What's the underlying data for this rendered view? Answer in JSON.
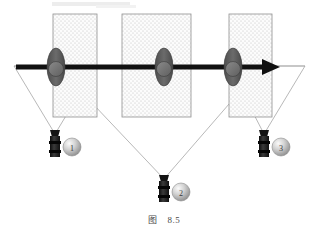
{
  "figure": {
    "caption_label": "图",
    "caption_number": "8.5",
    "title": "",
    "background_color": "#ffffff",
    "line_color_thin": "#9a9a9a",
    "axis_color": "#111111",
    "region_fill": "#fbfbfb",
    "region_border": "#8f8f8f",
    "region_dot_color": "#b9b9b9",
    "ellipse_fill": "#5d5d5d",
    "ellipse_inner_fill": "#7a7a7a",
    "camera_body_color": "#1b1b1b",
    "sphere_light": "#f2f2f2",
    "sphere_mid": "#b6b6b6",
    "sphere_dark": "#7c7c7c",
    "label_color": "#3a3a3a"
  },
  "axis": {
    "name": "horizontal-axis-arrow",
    "start_x": 16,
    "end_x": 279,
    "y": 67,
    "thickness": 5
  },
  "regions": [
    {
      "id": "region-left",
      "x": 53,
      "y": 14,
      "width": 44,
      "height": 103
    },
    {
      "id": "region-middle",
      "x": 122,
      "y": 14,
      "width": 69,
      "height": 103
    },
    {
      "id": "region-right",
      "x": 229,
      "y": 14,
      "width": 43,
      "height": 103
    }
  ],
  "nodes": [
    {
      "id": "node-left",
      "cx": 56,
      "cy": 67,
      "rx": 9,
      "ry": 19,
      "inner_r": 7
    },
    {
      "id": "node-middle",
      "cx": 164,
      "cy": 67,
      "rx": 9,
      "ry": 19,
      "inner_r": 7
    },
    {
      "id": "node-right",
      "cx": 233,
      "cy": 67,
      "rx": 9,
      "ry": 19,
      "inner_r": 7
    }
  ],
  "cameras": [
    {
      "id": "camera-1",
      "label": "1",
      "x": 55,
      "y": 135,
      "sphere_cx": 72,
      "sphere_cy": 147,
      "sphere_r": 9,
      "cone": {
        "apex_x": 55,
        "apex_y": 134,
        "left_x": 14,
        "left_y": 66,
        "right_x": 96,
        "right_y": 66
      }
    },
    {
      "id": "camera-2",
      "label": "2",
      "x": 164,
      "y": 180,
      "sphere_cx": 181,
      "sphere_cy": 192,
      "sphere_r": 9,
      "cone": {
        "apex_x": 164,
        "apex_y": 179,
        "left_x": 57,
        "left_y": 66,
        "right_x": 262,
        "right_y": 66
      }
    },
    {
      "id": "camera-3",
      "label": "3",
      "x": 264,
      "y": 135,
      "sphere_cx": 281,
      "sphere_cy": 147,
      "sphere_r": 9,
      "cone": {
        "apex_x": 264,
        "apex_y": 134,
        "left_x": 229,
        "left_y": 66,
        "right_x": 305,
        "right_y": 66
      }
    }
  ],
  "sight_lines": {
    "name": "camera-view-cones",
    "count": 3
  }
}
